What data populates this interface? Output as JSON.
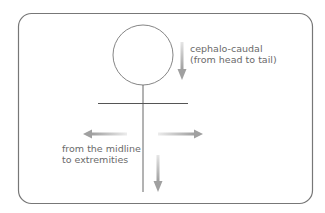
{
  "diagram": {
    "labels": {
      "cephalo_line1": "cephalo-caudal",
      "cephalo_line2": "(from head to tail)",
      "midline_line1": "from the midline",
      "midline_line2": "to extremities"
    },
    "colors": {
      "frame": "#777777",
      "figure": "#666666",
      "arrow": "#a8a8a8",
      "text": "#6a6a6a"
    }
  }
}
